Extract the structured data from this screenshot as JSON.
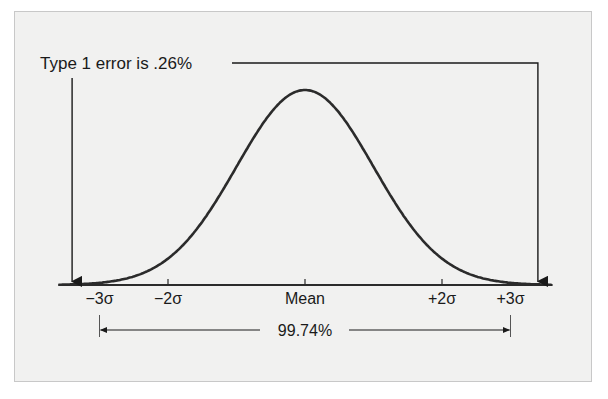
{
  "chart_data": {
    "type": "area",
    "title": "Type 1 error is .26%",
    "distribution": "normal",
    "x_range_sigma": [
      -3.6,
      3.6
    ],
    "ticks": [
      {
        "sigma": -3,
        "label": "−3σ"
      },
      {
        "sigma": -2,
        "label": "−2σ"
      },
      {
        "sigma": 0,
        "label": "Mean"
      },
      {
        "sigma": 2,
        "label": "+2σ"
      },
      {
        "sigma": 3,
        "label": "+3σ"
      }
    ],
    "shaded_regions": [
      {
        "from_sigma": -3.6,
        "to_sigma": -3,
        "meaning": "lower tail"
      },
      {
        "from_sigma": 3,
        "to_sigma": 3.6,
        "meaning": "upper tail"
      }
    ],
    "central_interval": {
      "from_sigma": -3,
      "to_sigma": 3,
      "label": "99.74%"
    },
    "annotation": "Type 1 error is .26%",
    "grid": false,
    "legend": "none",
    "colors": {
      "curve": "#2b2b2b",
      "shade": "#b9b9b9",
      "panel": "#f1f1f0"
    }
  }
}
